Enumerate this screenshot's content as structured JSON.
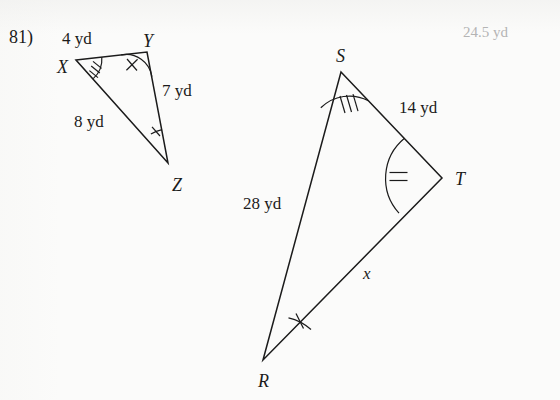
{
  "page": {
    "problem_number": "81)",
    "answer": "24.5 yd",
    "ghost_line": "",
    "ink_color": "#1b1b1b",
    "answer_color": "#b4b4b4",
    "paper_color": "#fbfbfa"
  },
  "figures": [
    {
      "name": "triangle-xyz",
      "vertices": [
        {
          "label": "X",
          "x": 76,
          "y": 60,
          "label_x": 57,
          "label_y": 58,
          "tick_count": 3
        },
        {
          "label": "Y",
          "x": 147,
          "y": 52,
          "label_x": 143,
          "label_y": 32,
          "tick_count": 2
        },
        {
          "label": "Z",
          "x": 168,
          "y": 163,
          "label_x": 172,
          "label_y": 176,
          "tick_count": 1
        }
      ],
      "sides": [
        {
          "from": "X",
          "to": "Y",
          "label": "4 yd",
          "label_x": 62,
          "label_y": 30
        },
        {
          "from": "Y",
          "to": "Z",
          "label": "7 yd",
          "label_x": 162,
          "label_y": 82
        },
        {
          "from": "X",
          "to": "Z",
          "label": "8 yd",
          "label_x": 74,
          "label_y": 113
        }
      ]
    },
    {
      "name": "triangle-rst",
      "vertices": [
        {
          "label": "S",
          "x": 341,
          "y": 72,
          "label_x": 336,
          "label_y": 47,
          "tick_count": 3
        },
        {
          "label": "T",
          "x": 442,
          "y": 178,
          "label_x": 455,
          "label_y": 170,
          "tick_count": 2
        },
        {
          "label": "R",
          "x": 263,
          "y": 360,
          "label_x": 258,
          "label_y": 372,
          "tick_count": 1
        }
      ],
      "sides": [
        {
          "from": "S",
          "to": "T",
          "label": "14 yd",
          "label_x": 399,
          "label_y": 99
        },
        {
          "from": "R",
          "to": "S",
          "label": "28 yd",
          "label_x": 243,
          "label_y": 195
        },
        {
          "from": "R",
          "to": "T",
          "label": "x",
          "label_x": 363,
          "label_y": 265
        }
      ]
    }
  ]
}
